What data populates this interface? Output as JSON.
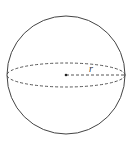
{
  "diagram": {
    "shape": "sphere",
    "radius_label": "r",
    "colors": {
      "stroke": "#444444",
      "background": "#ffffff"
    },
    "geometry": {
      "center": [
        66,
        75
      ],
      "radius": 59,
      "equator_ry": 12
    }
  }
}
